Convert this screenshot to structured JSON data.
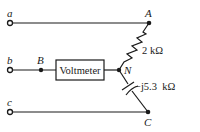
{
  "diagram": {
    "terminals": [
      {
        "id": "a",
        "label": "a"
      },
      {
        "id": "b",
        "label": "b"
      },
      {
        "id": "c",
        "label": "c"
      }
    ],
    "nodes": [
      {
        "id": "A",
        "label": "A"
      },
      {
        "id": "B",
        "label": "B"
      },
      {
        "id": "N",
        "label": "N"
      },
      {
        "id": "C",
        "label": "C"
      }
    ],
    "components": {
      "resistor": {
        "value": "2 kΩ"
      },
      "capacitor": {
        "value": "−j5.3  kΩ"
      },
      "meter": {
        "label": "Voltmeter"
      }
    },
    "colors": {
      "ink": "#1a1a1a",
      "background": "#ffffff"
    }
  }
}
